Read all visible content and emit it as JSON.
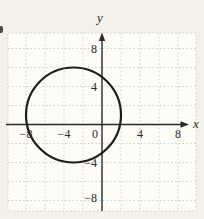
{
  "figure": {
    "x_axis_label": "x",
    "y_axis_label": "y",
    "x_tick_labels": [
      "−8",
      "−4",
      "0",
      "4",
      "8"
    ],
    "y_tick_labels": [
      "8",
      "4",
      "−4",
      "−8"
    ]
  },
  "chart_data": {
    "type": "line",
    "subtype": "circle-on-coordinate-plane",
    "title": "",
    "xlabel": "x",
    "ylabel": "y",
    "xlim": [
      -10,
      10
    ],
    "ylim": [
      -10,
      10
    ],
    "x_ticks": [
      -8,
      -4,
      0,
      4,
      8
    ],
    "y_ticks": [
      8,
      4,
      -4,
      -8
    ],
    "grid": {
      "visible": true,
      "style": "dotted",
      "spacing_units": 2
    },
    "series": [
      {
        "name": "circle",
        "shape": "circle",
        "center": [
          -3,
          1
        ],
        "radius": 5,
        "x_extent": [
          -8,
          2
        ],
        "y_extent": [
          -4,
          6
        ],
        "equation": "(x + 3)² + (y − 1)² = 25"
      }
    ],
    "legend": "none"
  },
  "colors": {
    "curve": "#1e1d1b",
    "axis": "#2a2927",
    "grid": "#c6cabf",
    "text": "#2e2d2b",
    "paper": "#f3f1ea",
    "plot_bg": "#fdfcf7"
  }
}
